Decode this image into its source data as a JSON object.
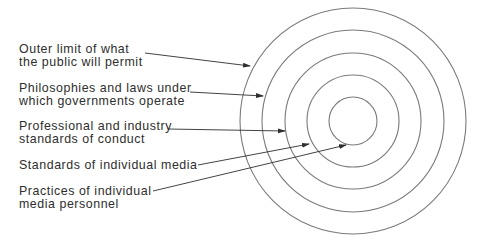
{
  "diagram": {
    "type": "concentric-circles",
    "center": [
      353,
      121
    ],
    "rings": [
      {
        "id": "ring-1",
        "radius": 113,
        "label_index": 0
      },
      {
        "id": "ring-2",
        "radius": 91,
        "label_index": 1
      },
      {
        "id": "ring-3",
        "radius": 68,
        "label_index": 2
      },
      {
        "id": "ring-4",
        "radius": 46,
        "label_index": 3
      },
      {
        "id": "ring-5",
        "radius": 24,
        "label_index": 4
      }
    ],
    "stroke_color": "#7a7a7a",
    "arrow_color": "#2e2e2e"
  },
  "labels": [
    {
      "line1": "Outer limit of what",
      "line2": "the public will permit"
    },
    {
      "line1": "Philosophies and laws under",
      "line2": "which governments operate"
    },
    {
      "line1": "Professional and industry",
      "line2": "standards of conduct"
    },
    {
      "line1": "Standards of individual media",
      "line2": ""
    },
    {
      "line1": "Practices of individual",
      "line2": "media personnel"
    }
  ],
  "arrows": [
    {
      "from": [
        145,
        53
      ],
      "to": [
        250,
        66
      ]
    },
    {
      "from": [
        190,
        92
      ],
      "to": [
        263,
        96
      ]
    },
    {
      "from": [
        168,
        129
      ],
      "to": [
        285,
        131
      ]
    },
    {
      "from": [
        198,
        165
      ],
      "to": [
        309,
        144
      ]
    },
    {
      "from": [
        153,
        191
      ],
      "to": [
        346,
        145
      ]
    }
  ]
}
